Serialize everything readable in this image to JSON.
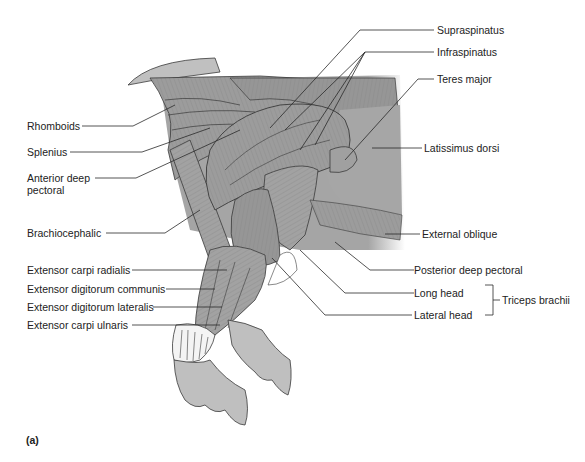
{
  "figure": {
    "panel_letter": "(a)",
    "colors": {
      "muscle_fill": "#9a9a9a",
      "muscle_light": "#b3b3b3",
      "muscle_dark": "#7d7d7d",
      "skin_fill": "#bdbdbd",
      "outline": "#3a3a3a",
      "leader_line": "#2a2a2a",
      "text": "#222222",
      "background": "#ffffff"
    },
    "labels_left": [
      {
        "text": "Rhomboids"
      },
      {
        "text": "Splenius"
      },
      {
        "text": "Anterior deep"
      },
      {
        "text": "pectoral"
      },
      {
        "text": "Brachiocephalic"
      },
      {
        "text": "Extensor carpi radialis"
      },
      {
        "text": "Extensor digitorum communis"
      },
      {
        "text": "Extensor digitorum lateralis"
      },
      {
        "text": "Extensor carpi ulnaris"
      }
    ],
    "labels_right": [
      {
        "text": "Supraspinatus"
      },
      {
        "text": "Infraspinatus"
      },
      {
        "text": "Teres major"
      },
      {
        "text": "Latissimus dorsi"
      },
      {
        "text": "External oblique"
      },
      {
        "text": "Posterior deep pectoral"
      },
      {
        "text": "Long head"
      },
      {
        "text": "Lateral head"
      }
    ],
    "group_label": {
      "text": "Triceps brachii",
      "members": [
        "Long head",
        "Lateral head"
      ]
    }
  }
}
